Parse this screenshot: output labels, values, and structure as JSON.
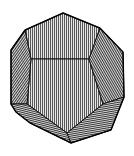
{
  "figure": {
    "style": "engraved line drawing with hatched faces",
    "colors": {
      "background": "#ffffff",
      "ink": "#111111",
      "face_light": "#d9d9d9"
    },
    "vertices": {
      "top": [
        63,
        13
      ],
      "upper_left": [
        25,
        30
      ],
      "upper_right": [
        100,
        28
      ],
      "left_outer_top": [
        11,
        50
      ],
      "right_outer_top": [
        123,
        52
      ],
      "inner_left": [
        31,
        59
      ],
      "inner_right": [
        89,
        59
      ],
      "left_outer_bottom": [
        11,
        104
      ],
      "right_outer_bottom": [
        124,
        97
      ],
      "inner_lower_left": [
        27,
        104
      ],
      "inner_lower_right": [
        103,
        104
      ],
      "lower_left_curve": [
        16,
        112
      ],
      "bottom_left": [
        30,
        123
      ],
      "bottom_inner": [
        67,
        133
      ],
      "bottom": [
        71,
        143
      ],
      "bottom_right": [
        111,
        130
      ]
    }
  }
}
